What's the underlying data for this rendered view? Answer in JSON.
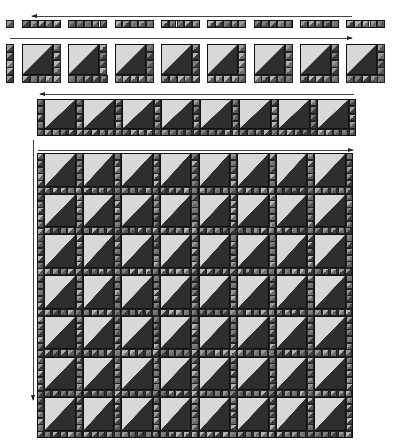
{
  "diagram": {
    "colors": {
      "light": "#d8d8d8",
      "dark": "#2e2e2e",
      "sash_dark": "#4a4a4a",
      "sash_light": "#9a9a9a",
      "outline": "#111111",
      "arrow": "#444444"
    },
    "steps": [
      {
        "id": "row1",
        "label": "Sashing strips",
        "count": 8,
        "units_per_strip": 5,
        "arrow_direction": "left"
      },
      {
        "id": "row2",
        "label": "Blocks with sashing",
        "count": 8,
        "arrow_direction": "right"
      },
      {
        "id": "row3",
        "label": "Joined row",
        "count": 8,
        "arrow_direction": "left"
      },
      {
        "id": "quilt",
        "label": "Assembled quilt",
        "rows": 7,
        "cols": 8,
        "arrow_direction": "right",
        "vertical_arrow": "down"
      }
    ]
  }
}
